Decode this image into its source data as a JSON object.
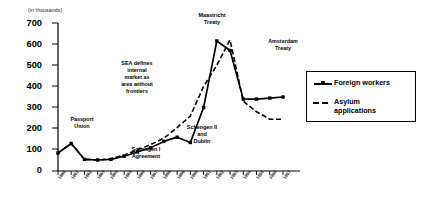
{
  "chart_data": {
    "type": "line",
    "title": "",
    "subtitle": "",
    "units_note": "(in thousands)",
    "xlabel": "",
    "ylabel": "",
    "ylim": [
      0,
      700
    ],
    "ytick_step": 100,
    "yticks": [
      "0",
      "100",
      "200",
      "300",
      "400",
      "500",
      "600",
      "700"
    ],
    "grid": false,
    "legend_position": "right",
    "categories": [
      "1980",
      "1981",
      "1982",
      "1983",
      "1984",
      "1985",
      "1986",
      "1987",
      "1988",
      "1989",
      "1990",
      "1991",
      "1992",
      "1993",
      "1994",
      "1995",
      "1996",
      "1997"
    ],
    "series": [
      {
        "name": "Foreign workers",
        "style": "solid-with-markers",
        "values": [
          85,
          130,
          55,
          52,
          55,
          70,
          90,
          110,
          140,
          160,
          135,
          300,
          615,
          570,
          340,
          340,
          345,
          350
        ]
      },
      {
        "name": "Asylum applications",
        "style": "dashed",
        "values": [
          85,
          130,
          55,
          52,
          58,
          75,
          100,
          125,
          155,
          205,
          260,
          400,
          500,
          620,
          330,
          280,
          245,
          245
        ]
      }
    ],
    "annotations": [
      {
        "id": "passport-union",
        "text": "Passport\nUnion"
      },
      {
        "id": "schengen-i",
        "text": "Schengen I\nAgreement"
      },
      {
        "id": "sea",
        "text": "SEA defines\ninternal\nmarket as\narea without\nfrontiers"
      },
      {
        "id": "maastricht",
        "text": "Maastricht\nTreaty"
      },
      {
        "id": "schengen-ii",
        "text": "Schengen II\nand\nDublin"
      },
      {
        "id": "amsterdam",
        "text": "Amsterdam\nTreaty"
      }
    ]
  },
  "legend": {
    "items": [
      {
        "label": "Foreign workers",
        "marker": "solid-line-marker-icon"
      },
      {
        "label": "Asylum\napplications",
        "marker": "dashed-line-icon"
      }
    ]
  },
  "colors": {
    "line": "#000000",
    "axis": "#000000",
    "background": "#ffffff",
    "text": "#000000"
  }
}
